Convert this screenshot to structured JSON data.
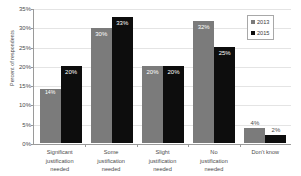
{
  "chart_data": {
    "type": "bar",
    "title": "",
    "xlabel": "",
    "ylabel": "Percent of respondents",
    "ylim": [
      0,
      35
    ],
    "ytick_labels": [
      "0%",
      "5%",
      "10%",
      "15%",
      "20%",
      "25%",
      "30%",
      "35%"
    ],
    "ytick_values": [
      0,
      5,
      10,
      15,
      20,
      25,
      30,
      35
    ],
    "grid": true,
    "legend_position": "top-right",
    "categories": [
      "Significant justification needed",
      "Some justification needed",
      "Slight justification needed",
      "No justification needed",
      "Don't know"
    ],
    "category_lines": [
      [
        "Significant",
        "justification",
        "needed"
      ],
      [
        "Some",
        "justification",
        "needed"
      ],
      [
        "Slight",
        "justification",
        "needed"
      ],
      [
        "No",
        "justification",
        "needed"
      ],
      [
        "Don't know"
      ]
    ],
    "series": [
      {
        "name": "2013",
        "color": "#7b7b7b",
        "values": [
          14,
          30,
          20,
          32,
          4
        ],
        "labels": [
          "14%",
          "30%",
          "20%",
          "32%",
          "4%"
        ]
      },
      {
        "name": "2015",
        "color": "#0d0d0d",
        "values": [
          20,
          33,
          20,
          25,
          2
        ],
        "labels": [
          "20%",
          "33%",
          "20%",
          "25%",
          "2%"
        ]
      }
    ]
  },
  "legend": {
    "items": [
      {
        "label": "2013",
        "color": "#7b7b7b"
      },
      {
        "label": "2015",
        "color": "#0d0d0d"
      }
    ]
  }
}
